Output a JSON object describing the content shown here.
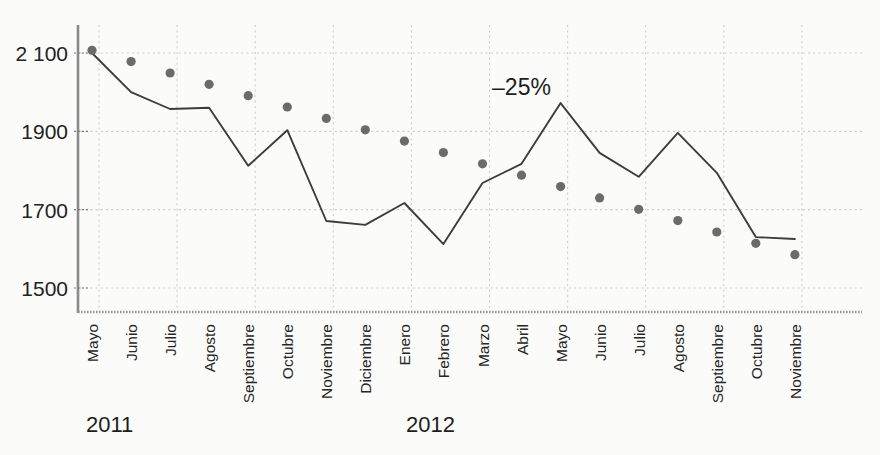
{
  "chart_data": {
    "type": "line",
    "title": "",
    "subtitle": "",
    "xlabel": "",
    "ylabel": "",
    "ylim": [
      1440,
      2145
    ],
    "yticks": [
      1500,
      1700,
      1900,
      2100
    ],
    "ytick_labels": [
      "1500",
      "1700",
      "1900",
      "2 100"
    ],
    "grid": true,
    "legend_position": "none",
    "categories": [
      "Mayo",
      "Junio",
      "Julio",
      "Agosto",
      "Septiembre",
      "Octubre",
      "Noviembre",
      "Diciembre",
      "Enero",
      "Febrero",
      "Marzo",
      "Abril",
      "Mayo",
      "Junio",
      "Julio",
      "Agosto",
      "Septiembre",
      "Octubre",
      "Noviembre"
    ],
    "year_groups": [
      {
        "label": "2011",
        "start_index": 0,
        "end_index": 7
      },
      {
        "label": "2012",
        "start_index": 8,
        "end_index": 18
      }
    ],
    "series": [
      {
        "name": "serie-mensual",
        "style": "line",
        "color": "#3c3c3c",
        "values": [
          2100,
          2000,
          1957,
          1960,
          1812,
          1903,
          1671,
          1661,
          1717,
          1612,
          1768,
          1817,
          1972,
          1845,
          1784,
          1896,
          1794,
          1630,
          1625
        ]
      },
      {
        "name": "tendencia-punteada",
        "style": "dotted",
        "color": "#6b6b6b",
        "values": [
          2107,
          2078,
          2049,
          2020,
          1991,
          1962,
          1933,
          1904,
          1875,
          1846,
          1817,
          1788,
          1759,
          1730,
          1701,
          1672,
          1643,
          1614,
          1585
        ]
      }
    ],
    "annotations": [
      {
        "text": "–25%",
        "x_index": 11,
        "y_value": 1993
      }
    ]
  },
  "axis": {
    "y_labels": [
      "2 100",
      "1900",
      "1700",
      "1500"
    ],
    "x_labels": [
      "Mayo",
      "Junio",
      "Julio",
      "Agosto",
      "Septiembre",
      "Octubre",
      "Noviembre",
      "Diciembre",
      "Enero",
      "Febrero",
      "Marzo",
      "Abril",
      "Mayo",
      "Junio",
      "Julio",
      "Agosto",
      "Septiembre",
      "Octubre",
      "Noviembre"
    ],
    "year_2011": "2011",
    "year_2012": "2012"
  },
  "annotation": {
    "decline_label": "–25%"
  },
  "colors": {
    "line": "#3c3c3c",
    "dots": "#6b6b6b",
    "grid": "#cccccc",
    "axis": "#8a8a8a",
    "text": "#222222",
    "background": "#fbfbf9"
  }
}
